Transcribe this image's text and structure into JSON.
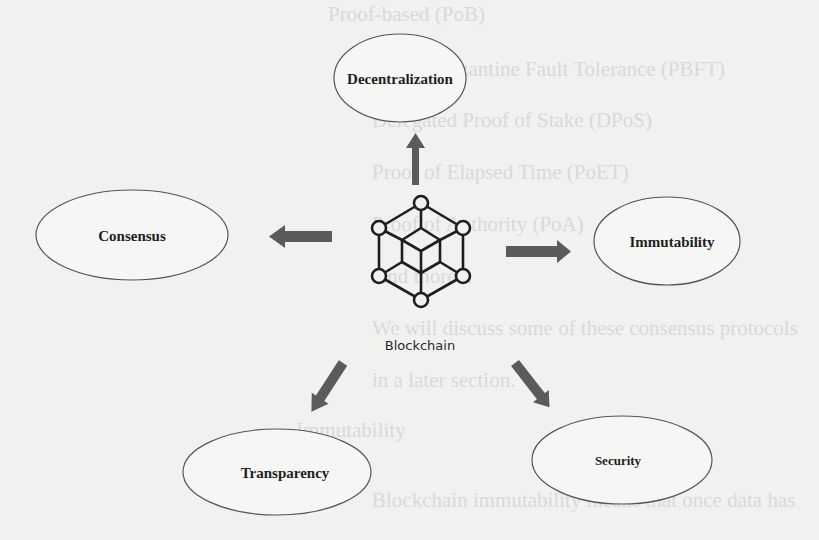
{
  "diagram": {
    "center": {
      "label": "Blockchain",
      "icon": "hexagon-cube-network-icon"
    },
    "nodes": [
      {
        "id": "decentralization",
        "label": "Decentralization"
      },
      {
        "id": "consensus",
        "label": "Consensus"
      },
      {
        "id": "immutability",
        "label": "Immutability"
      },
      {
        "id": "transparency",
        "label": "Transparency"
      },
      {
        "id": "security",
        "label": "Security"
      }
    ],
    "colors": {
      "background": "#f1f1f0",
      "ellipse_stroke": "#555555",
      "arrow_fill": "#5b5b5b",
      "icon_stroke": "#1e1e1e",
      "text": "#1e1e1e"
    }
  },
  "background_show_through": {
    "lines": [
      "Proof-based (PoB)",
      "Practical Byzantine Fault Tolerance (PBFT)",
      "Delegated Proof of Stake (DPoS)",
      "Proof of Elapsed Time (PoET)",
      "Proof of Authority (PoA)",
      "And more...",
      "We will discuss some of these consensus protocols",
      "in a later section.",
      "Immutability",
      "Blockchain immutability means that once data has"
    ]
  }
}
